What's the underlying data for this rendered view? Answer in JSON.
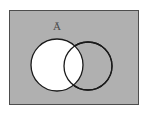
{
  "figure": {
    "kind": "venn-diagram",
    "caption_label": "Ā",
    "label_plain": "A-bar",
    "label_meaning": "complement of set A",
    "set_labels": [
      "Ā"
    ],
    "colors": {
      "page_background": "#ffffff",
      "universe_fill": "#b0b0b0",
      "universe_stroke": "#4d4d4d",
      "circle_stroke": "#1a1a1a",
      "shaded_region_fill": "#ffffff",
      "unshaded_region_fill": "none",
      "label_color": "#4a4a4a"
    },
    "universe_rect": {
      "x": 9,
      "y": 10,
      "width": 130,
      "height": 95,
      "stroke_width": 1
    },
    "label_position": {
      "x": 57,
      "y": 30
    },
    "circles": [
      {
        "name": "left-circle",
        "cx": 57,
        "cy": 65,
        "r": 26,
        "fill": "#ffffff",
        "stroke": "#1a1a1a",
        "stroke_width": 1.3,
        "filled": "true"
      },
      {
        "name": "right-circle",
        "cx": 88,
        "cy": 66,
        "r": 24,
        "fill": "none",
        "stroke": "#1a1a1a",
        "stroke_width": 1.3,
        "filled": "false"
      }
    ]
  }
}
